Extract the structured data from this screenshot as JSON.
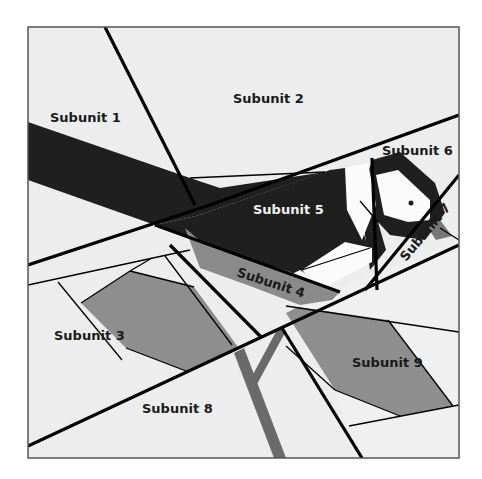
{
  "diagram": {
    "frame": {
      "x": 28,
      "y": 27,
      "width": 431,
      "height": 431
    },
    "colors": {
      "background": "#ececec",
      "light": "#eeeeee",
      "white": "#fbfbfb",
      "black": "#1f1f1f",
      "mid_gray": "#8e8e8e",
      "dark_gray": "#6a6a6a",
      "line": "#000000",
      "frame": "#555555"
    },
    "labels": [
      {
        "id": "subunit-1",
        "text": "Subunit 1",
        "x": 50,
        "y": 122,
        "rotate": 0,
        "tone": "dark"
      },
      {
        "id": "subunit-2",
        "text": "Subunit 2",
        "x": 233,
        "y": 103,
        "rotate": 0,
        "tone": "dark"
      },
      {
        "id": "subunit-3",
        "text": "Subunit 3",
        "x": 54,
        "y": 340,
        "rotate": 0,
        "tone": "dark"
      },
      {
        "id": "subunit-4",
        "text": "Subunit 4",
        "x": 236,
        "y": 276,
        "rotate": 18,
        "tone": "dark"
      },
      {
        "id": "subunit-5",
        "text": "Subunit 5",
        "x": 253,
        "y": 214,
        "rotate": 0,
        "tone": "light"
      },
      {
        "id": "subunit-6",
        "text": "Subunit 6",
        "x": 382,
        "y": 155,
        "rotate": 0,
        "tone": "dark"
      },
      {
        "id": "subunit-7",
        "text": "Subunit 7",
        "x": 406,
        "y": 262,
        "rotate": -50,
        "tone": "dark"
      },
      {
        "id": "subunit-8",
        "text": "Subunit 8",
        "x": 142,
        "y": 413,
        "rotate": 0,
        "tone": "dark"
      },
      {
        "id": "subunit-9",
        "text": "Subunit 9",
        "x": 352,
        "y": 367,
        "rotate": 0,
        "tone": "dark"
      }
    ]
  }
}
